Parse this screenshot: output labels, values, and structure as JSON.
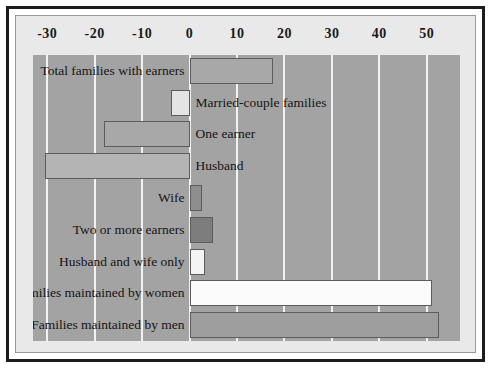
{
  "chart_data": {
    "type": "bar",
    "orientation": "horizontal",
    "title": "",
    "xlabel": "",
    "ylabel": "",
    "xlim": [
      -33,
      57
    ],
    "grid": true,
    "legend": "none",
    "tick_labels": [
      "-30",
      "-20",
      "-10",
      "0",
      "10",
      "20",
      "30",
      "40",
      "50"
    ],
    "ticks": [
      -30,
      -20,
      -10,
      0,
      10,
      20,
      30,
      40,
      50
    ],
    "categories": [
      "Total families with earners",
      "Married-couple families",
      "One earner",
      "Husband",
      "Wife",
      "Two or more earners",
      "Husband and wife only",
      "Families maintained by women",
      "Families maintained by men"
    ],
    "values": [
      17.5,
      -4.0,
      -18.0,
      -30.5,
      2.6,
      5.0,
      3.3,
      51.0,
      52.5
    ],
    "bar_colors": [
      "#a8a8a8",
      "#e4e4e4",
      "#a8a8a8",
      "#b4b4b4",
      "#8e8e8e",
      "#7d7d7d",
      "#f4f4f4",
      "#fbfbfb",
      "#9e9e9e"
    ],
    "label_side": [
      "left",
      "right",
      "right",
      "right",
      "left",
      "left",
      "left",
      "left",
      "left"
    ]
  },
  "style": {
    "plot_background": "#a3a3a3",
    "panel_background": "#e9e9e9",
    "gridline_color": "#f2f2f2",
    "frame_color": "#1c1c1c",
    "bar_border_color": "#5c5c5c",
    "text_color": "#151515"
  }
}
